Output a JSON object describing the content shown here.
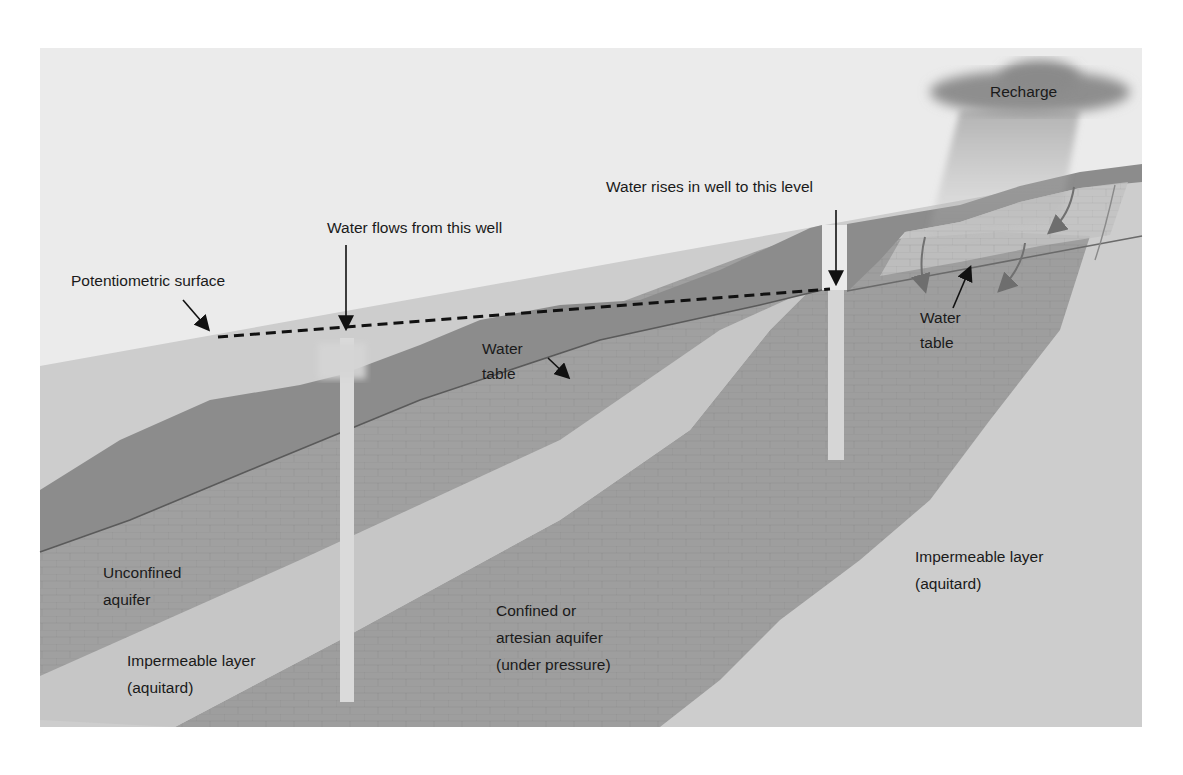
{
  "diagram": {
    "colors": {
      "sky": "#ebebeb",
      "unsaturated_zone": "#8c8c8c",
      "unconfined_aquifer": "#a2a2a2",
      "aquitard_light": "#c8c8c8",
      "confined_aquifer": "#9e9e9e",
      "lower_aquitard": "#cdcdcd",
      "well_casing": "#dadada",
      "cloud": "#8e8e8e",
      "text": "#1a1a1a"
    },
    "labels": {
      "recharge": "Recharge",
      "water_rises": "Water rises in well to this level",
      "water_flows": "Water flows from this well",
      "potentiometric": "Potentiometric surface",
      "water_table_left": [
        "Water",
        "table"
      ],
      "water_table_right": [
        "Water",
        "table"
      ],
      "unconfined": [
        "Unconfined",
        "aquifer"
      ],
      "confined": [
        "Confined or",
        "artesian aquifer",
        "(under pressure)"
      ],
      "aquitard_left": [
        "Impermeable layer",
        "(aquitard)"
      ],
      "aquitard_right": [
        "Impermeable layer",
        "(aquitard)"
      ]
    },
    "features": {
      "wells": [
        {
          "name": "flowing-artesian-well",
          "x": 347,
          "top": 320,
          "bottom": 702
        },
        {
          "name": "non-flowing-artesian-well",
          "x": 835,
          "top": 290,
          "bottom": 460
        }
      ],
      "potentiometric_line": {
        "x1": 218,
        "y1": 337,
        "x2": 830,
        "y2": 289,
        "style": "dashed"
      },
      "recharge_arrows": 4
    }
  }
}
